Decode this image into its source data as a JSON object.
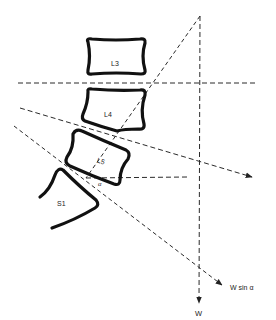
{
  "diagram": {
    "type": "lumbosacral spine force diagram",
    "vertebrae": [
      {
        "id": "L3",
        "label": "L3"
      },
      {
        "id": "L4",
        "label": "L4"
      },
      {
        "id": "L5",
        "label": "L5"
      },
      {
        "id": "S1",
        "label": "S1"
      }
    ],
    "angle_label": "α",
    "forces": [
      {
        "id": "weight",
        "label": "W"
      },
      {
        "id": "shear",
        "label": "W sin α"
      }
    ],
    "colors": {
      "line": "#2a2a2a",
      "bone": "#111111",
      "background": "#ffffff"
    }
  }
}
